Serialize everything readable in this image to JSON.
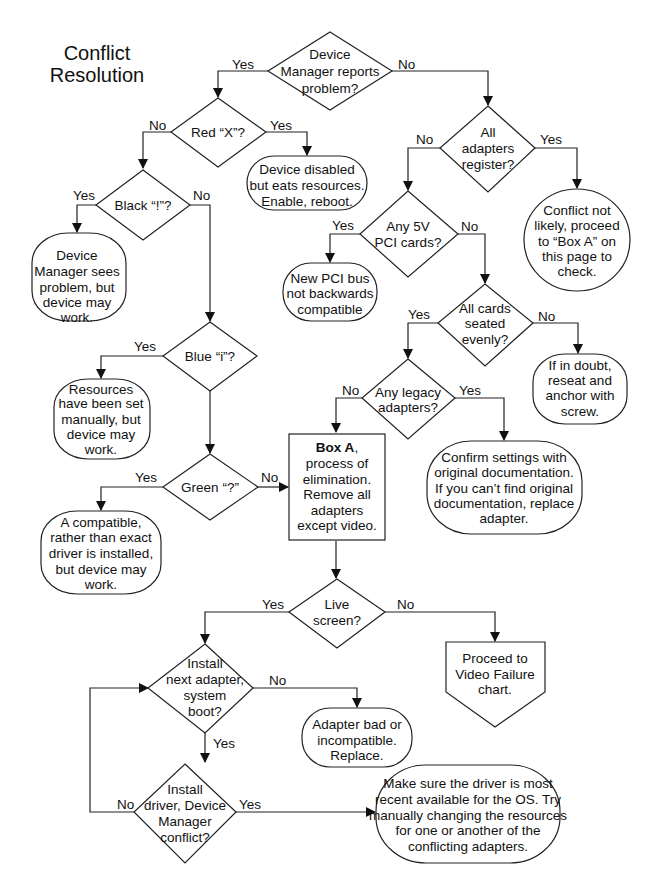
{
  "title": {
    "line1": "Conflict",
    "line2": "Resolution"
  },
  "decisions": {
    "device_manager": [
      "Device",
      "Manager reports",
      "problem?"
    ],
    "red_x": [
      "Red “X”?"
    ],
    "black_bang": [
      "Black “!”?"
    ],
    "blue_i": [
      "Blue “i”?"
    ],
    "green_q": [
      "Green “?”"
    ],
    "all_adapters": [
      "All",
      "adapters",
      "register?"
    ],
    "any_5v": [
      "Any 5V",
      "PCI cards?"
    ],
    "seated": [
      "All cards",
      "seated",
      "evenly?"
    ],
    "legacy": [
      "Any legacy",
      "adapters?"
    ],
    "live_screen": [
      "Live",
      "screen?"
    ],
    "install_next": [
      "Install",
      "next adapter,",
      "system",
      "boot?"
    ],
    "install_driver": [
      "Install",
      "driver, Device",
      "Manager",
      "conflict?"
    ]
  },
  "outcomes": {
    "disabled": [
      "Device disabled",
      "but eats resources.",
      "Enable, reboot."
    ],
    "dm_sees": [
      "Device",
      "Manager sees",
      "problem, but",
      "device may",
      "work."
    ],
    "resources_set": [
      "Resources",
      "have been set",
      "manually, but",
      "device may",
      "work."
    ],
    "compatible": [
      "A compatible,",
      "rather than exact",
      "driver is installed,",
      "but device may",
      "work."
    ],
    "conflict_not_likely": [
      "Conflict not",
      "likely, proceed",
      "to “Box A” on",
      "this page to",
      "check."
    ],
    "new_pci": [
      "New PCI bus",
      "not backwards",
      "compatible"
    ],
    "reseat": [
      "If in doubt,",
      "reseat and",
      "anchor with",
      "screw."
    ],
    "confirm": [
      "Confirm settings with",
      "original documentation.",
      "If you can’t find original",
      "documentation, replace",
      "adapter."
    ],
    "video_failure": [
      "Proceed to",
      "Video Failure",
      "chart."
    ],
    "adapter_bad": [
      "Adapter bad or",
      "incompatible.",
      "Replace."
    ],
    "make_sure": [
      "Make sure the driver is most",
      "recent available for the OS. Try",
      "manually changing the resources",
      "for one or another of the",
      "conflicting adapters."
    ]
  },
  "box_a": {
    "bold": "Box A",
    "rest": ",",
    "lines": [
      "process of",
      "elimination.",
      "Remove all",
      "adapters",
      "except video."
    ]
  },
  "labels": {
    "yes": "Yes",
    "no": "No"
  }
}
